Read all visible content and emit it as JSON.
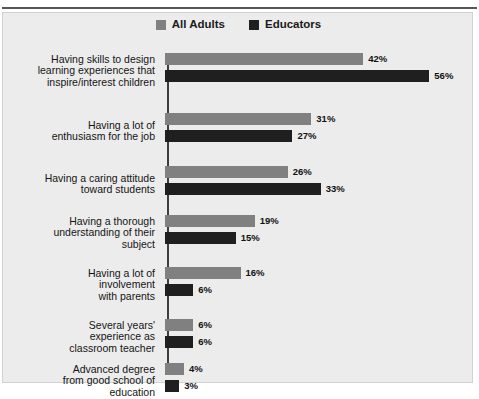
{
  "figure": {
    "title": "",
    "background": "#ececec",
    "page_background": "#ffffff"
  },
  "legend": {
    "position": "top-center",
    "entries": [
      {
        "label": "All Adults",
        "color": "#808080"
      },
      {
        "label": "Educators",
        "color": "#1f1f1f"
      }
    ]
  },
  "chart_data": {
    "type": "bar",
    "orientation": "horizontal",
    "title": "",
    "subtitle": "",
    "xlabel": "",
    "ylabel": "",
    "xlim": [
      0,
      60
    ],
    "grid": false,
    "value_suffix": "%",
    "legend_position": "top-center",
    "categories": [
      "Having skills to design\nlearning experiences that\ninspire/interest children",
      "Having a lot of\nenthusiasm for the job",
      "Having a caring attitude\ntoward students",
      "Having a thorough\nunderstanding of their\nsubject",
      "Having a lot of\ninvolvement\nwith parents",
      "Several years'\nexperience as\nclassroom teacher",
      "Advanced degree\nfrom good school of\neducation"
    ],
    "series": [
      {
        "name": "All Adults",
        "color": "#808080",
        "values": [
          42,
          31,
          26,
          19,
          16,
          6,
          4
        ],
        "labels": [
          "42%",
          "31%",
          "26%",
          "19%",
          "16%",
          "6%",
          "4%"
        ]
      },
      {
        "name": "Educators",
        "color": "#1f1f1f",
        "values": [
          56,
          27,
          33,
          15,
          6,
          6,
          3
        ],
        "labels": [
          "56%",
          "27%",
          "33%",
          "15%",
          "6%",
          "6%",
          "3%"
        ]
      }
    ]
  },
  "rows": [
    {
      "label": "Having skills to design\nlearning experiences that\ninspire/interest children",
      "all_adults": {
        "value": 42,
        "label": "42%"
      },
      "educators": {
        "value": 56,
        "label": "56%"
      }
    },
    {
      "label": "Having a lot of\nenthusiasm for the job",
      "all_adults": {
        "value": 31,
        "label": "31%"
      },
      "educators": {
        "value": 27,
        "label": "27%"
      }
    },
    {
      "label": "Having a caring attitude\ntoward students",
      "all_adults": {
        "value": 26,
        "label": "26%"
      },
      "educators": {
        "value": 33,
        "label": "33%"
      }
    },
    {
      "label": "Having a thorough\nunderstanding of their\nsubject",
      "all_adults": {
        "value": 19,
        "label": "19%"
      },
      "educators": {
        "value": 15,
        "label": "15%"
      }
    },
    {
      "label": "Having a lot of\ninvolvement\nwith parents",
      "all_adults": {
        "value": 16,
        "label": "16%"
      },
      "educators": {
        "value": 6,
        "label": "6%"
      }
    },
    {
      "label": "Several years'\nexperience as\nclassroom teacher",
      "all_adults": {
        "value": 6,
        "label": "6%"
      },
      "educators": {
        "value": 6,
        "label": "6%"
      }
    },
    {
      "label": "Advanced degree\nfrom good school of\neducation",
      "all_adults": {
        "value": 4,
        "label": "4%"
      },
      "educators": {
        "value": 3,
        "label": "3%"
      }
    }
  ]
}
